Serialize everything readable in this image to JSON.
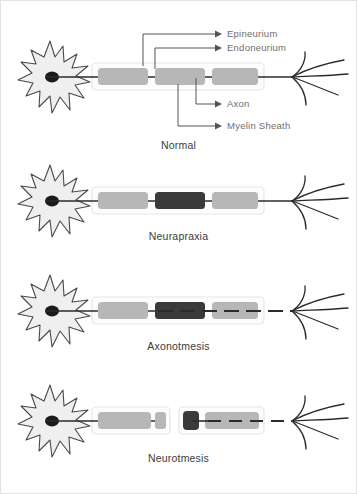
{
  "figure": {
    "title_visible": false,
    "background_color": "#ffffff",
    "border_color": "#e3e3e3",
    "width": 357,
    "height": 494
  },
  "colors": {
    "soma_fill": "#efefef",
    "soma_stroke": "#4a4a4a",
    "nucleus_fill": "#1b1b1b",
    "epineurium_fill": "#fdfdfd",
    "epineurium_stroke": "#e6e6e6",
    "myelin_light": "#b7b7b7",
    "myelin_dark": "#3a3a3a",
    "axon_line": "#2b2b2b",
    "leader_line": "#555555",
    "label_text": "#6e6e6e",
    "caption_text": "#3b3b3b",
    "terminal_stroke": "#2b2b2b"
  },
  "annotations": {
    "epineurium": {
      "label": "Epineurium"
    },
    "endoneurium": {
      "label": "Endoneurium"
    },
    "axon": {
      "label": "Axon"
    },
    "myelin_sheath": {
      "label": "Myelin Sheath"
    }
  },
  "panels": [
    {
      "id": "normal",
      "caption": "Normal",
      "description": "Intact nerve: continuous axon, three intact myelin segments, intact endoneurium and epineurium",
      "sheaths": [
        {
          "x": 92,
          "width": 172,
          "myelin": [
            {
              "x": 98,
              "width": 50,
              "shade": "light",
              "axon": "solid"
            },
            {
              "x": 155,
              "width": 50,
              "shade": "light",
              "axon": "solid"
            },
            {
              "x": 212,
              "width": 46,
              "shade": "light",
              "axon": "solid"
            }
          ],
          "axon": "solid"
        }
      ]
    },
    {
      "id": "neurapraxia",
      "caption": "Neurapraxia",
      "description": "Focal demyelination: middle myelin segment damaged (dark), axon remains continuous",
      "sheaths": [
        {
          "x": 92,
          "width": 172,
          "myelin": [
            {
              "x": 98,
              "width": 50,
              "shade": "light",
              "axon": "solid"
            },
            {
              "x": 155,
              "width": 50,
              "shade": "dark",
              "axon": "solid"
            },
            {
              "x": 212,
              "width": 46,
              "shade": "light",
              "axon": "solid"
            }
          ],
          "axon": "solid"
        }
      ]
    },
    {
      "id": "axonotmesis",
      "caption": "Axonotmesis",
      "description": "Axon and myelin disrupted distally, endoneurium and epineurium intact; distal axon fragmented",
      "sheaths": [
        {
          "x": 92,
          "width": 172,
          "myelin": [
            {
              "x": 98,
              "width": 50,
              "shade": "light",
              "axon": "solid"
            },
            {
              "x": 155,
              "width": 50,
              "shade": "dark",
              "axon": "dashed"
            },
            {
              "x": 212,
              "width": 46,
              "shade": "light",
              "axon": "dashed"
            }
          ],
          "axon": "broken"
        }
      ]
    },
    {
      "id": "neurotmesis",
      "caption": "Neurotmesis",
      "description": "Complete transection: epineurium severed into two separated stumps with a gap",
      "sheaths": [
        {
          "x": 92,
          "width": 78,
          "myelin": [
            {
              "x": 98,
              "width": 53,
              "shade": "light",
              "axon": "solid"
            },
            {
              "x": 155,
              "width": 11,
              "shade": "light",
              "axon": "none"
            }
          ],
          "axon": "solid"
        },
        {
          "x": 179,
          "width": 85,
          "myelin": [
            {
              "x": 183,
              "width": 16,
              "shade": "dark",
              "axon": "solid"
            },
            {
              "x": 205,
              "width": 54,
              "shade": "light",
              "axon": "dashed"
            }
          ],
          "axon": "broken"
        }
      ]
    }
  ]
}
